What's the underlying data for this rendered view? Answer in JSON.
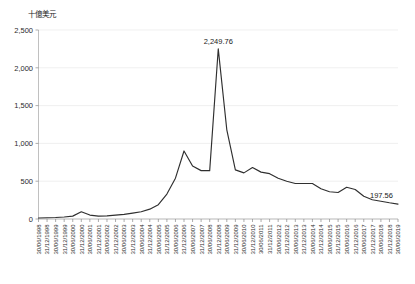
{
  "chart_data": {
    "type": "line",
    "title": "",
    "subtitle": "",
    "ylabel": "十億美元",
    "xlabel": "",
    "ylim": [
      0,
      2500
    ],
    "ytick_values": [
      0,
      500,
      1000,
      1500,
      2000,
      2500
    ],
    "ytick_labels": [
      "0",
      "500",
      "1,000",
      "1,500",
      "2,000",
      "2,500"
    ],
    "grid": true,
    "legend": false,
    "legend_position": "none",
    "line_color": "#2f2f2f",
    "grid_color": "#e9e9e9",
    "axis_color": "#b0b0b0",
    "categories": [
      "30/06/1998",
      "31/12/1998",
      "30/06/1999",
      "31/12/1999",
      "30/06/2000",
      "31/12/2000",
      "30/06/2001",
      "31/12/2001",
      "30/06/2002",
      "31/12/2002",
      "30/06/2003",
      "31/12/2003",
      "30/06/2004",
      "31/12/2004",
      "30/06/2005",
      "31/12/2005",
      "30/06/2006",
      "31/12/2006",
      "30/06/2007",
      "31/12/2007",
      "30/06/2008",
      "31/12/2008",
      "30/06/2009",
      "31/12/2009",
      "30/06/2010",
      "31/12/2010",
      "30/06/2011",
      "31/12/2011",
      "30/06/2012",
      "31/12/2012",
      "30/06/2013",
      "31/12/2013",
      "30/06/2014",
      "31/12/2014",
      "30/06/2015",
      "31/12/2015",
      "30/06/2016",
      "31/12/2016",
      "30/06/2017",
      "31/12/2017",
      "30/06/2018",
      "31/12/2018",
      "30/06/2019"
    ],
    "values": [
      13,
      16,
      20,
      27,
      38,
      95,
      52,
      38,
      42,
      52,
      62,
      78,
      96,
      130,
      190,
      330,
      540,
      900,
      700,
      640,
      640,
      2249.76,
      1180,
      650,
      610,
      680,
      620,
      600,
      540,
      500,
      470,
      470,
      470,
      400,
      360,
      350,
      420,
      390,
      300,
      255,
      235,
      215,
      197.56
    ],
    "annotations": [
      {
        "label": "2,249.76",
        "category": "31/12/2008",
        "value": 2249.76,
        "position": "above"
      },
      {
        "label": "197.56",
        "category": "30/06/2019",
        "value": 197.56,
        "position": "right"
      }
    ]
  }
}
